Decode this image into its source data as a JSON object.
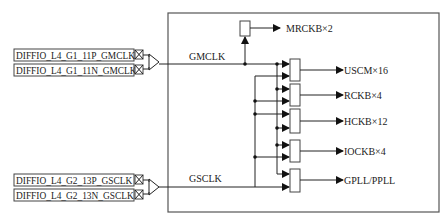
{
  "diagram": {
    "inputs": [
      {
        "pin": "DIFFIO_L4_G1_11P_GMCLK"
      },
      {
        "pin": "DIFFIO_L4_G1_11N_GMCLK"
      },
      {
        "pin": "DIFFIO_L4_G2_13P_GSCLK"
      },
      {
        "pin": "DIFFIO_L4_G2_13N_GSCLK"
      }
    ],
    "nets": {
      "gmclk": "GMCLK",
      "gsclk": "GSCLK"
    },
    "outputs": [
      {
        "label": "MRCKB×2"
      },
      {
        "label": "USCM×16"
      },
      {
        "label": "RCKB×4"
      },
      {
        "label": "HCKB×12"
      },
      {
        "label": "IOCKB×4"
      },
      {
        "label": "GPLL/PPLL"
      }
    ],
    "colors": {
      "line": "#222222",
      "frame": "#555555",
      "background": "#ffffff"
    }
  }
}
